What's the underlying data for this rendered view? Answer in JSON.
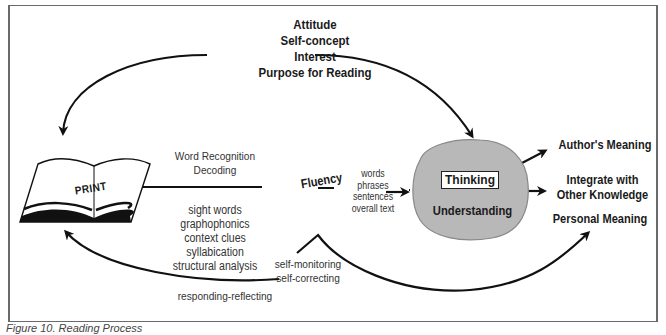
{
  "diagram": {
    "motivation": {
      "lines": [
        "Attitude",
        "Self-concept",
        "Interest",
        "Purpose for Reading"
      ]
    },
    "print_book": {
      "label": "PRINT"
    },
    "word_recognition": {
      "lines": [
        "Word Recognition",
        "Decoding"
      ]
    },
    "word_skills": {
      "lines": [
        "sight words",
        "graphophonics",
        "context clues",
        "syllabication",
        "structural analysis"
      ]
    },
    "fluency": {
      "label": "Fluency"
    },
    "text_units": {
      "lines": [
        "words",
        "phrases",
        "sentences",
        "overall text"
      ]
    },
    "cognition_blob": {
      "thinking_label": "Thinking",
      "understanding_label": "Understanding",
      "fill_color": "#b8b8b8"
    },
    "outcomes": {
      "authors_meaning": "Author's Meaning",
      "integrate": [
        "Integrate with",
        "Other Knowledge"
      ],
      "personal_meaning": "Personal Meaning"
    },
    "self_monitoring": {
      "lines": [
        "self-monitoring",
        "self-correcting"
      ]
    },
    "responding": {
      "label": "responding-reflecting"
    },
    "caption": "Figure 10. Reading Process"
  },
  "colors": {
    "ink": "#1a1a1a",
    "frame": "#6a6a6a",
    "blob": "#b8b8b8"
  }
}
